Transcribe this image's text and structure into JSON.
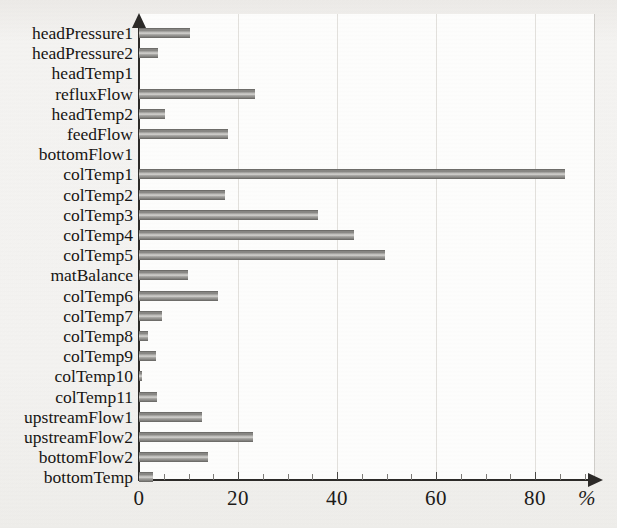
{
  "chart_data": {
    "type": "bar",
    "orientation": "horizontal",
    "title": "",
    "subtitle": "",
    "xlabel": "%",
    "ylabel": "",
    "xlim": [
      0,
      92
    ],
    "xticks": [
      0,
      20,
      40,
      60,
      80
    ],
    "xtick_labels": [
      "0",
      "20",
      "40",
      "60",
      "80"
    ],
    "grid": "vertical",
    "legend": "none",
    "categories": [
      "headPressure1",
      "headPressure2",
      "headTemp1",
      "refluxFlow",
      "headTemp2",
      "feedFlow",
      "bottomFlow1",
      "colTemp1",
      "colTemp2",
      "colTemp3",
      "colTemp4",
      "colTemp5",
      "matBalance",
      "colTemp6",
      "colTemp7",
      "colTemp8",
      "colTemp9",
      "colTemp10",
      "colTemp11",
      "upstreamFlow1",
      "upstreamFlow2",
      "bottomFlow2",
      "bottomTemp"
    ],
    "values": [
      10.3,
      3.8,
      0.0,
      23.4,
      5.3,
      18.0,
      0.0,
      86.0,
      17.4,
      36.2,
      43.4,
      49.7,
      9.9,
      16.0,
      4.6,
      1.8,
      3.4,
      0.6,
      3.6,
      12.7,
      23.0,
      14.0,
      2.8
    ]
  },
  "axis": {
    "unit_label": "%",
    "tick_labels": [
      "0",
      "20",
      "40",
      "60",
      "80"
    ]
  }
}
